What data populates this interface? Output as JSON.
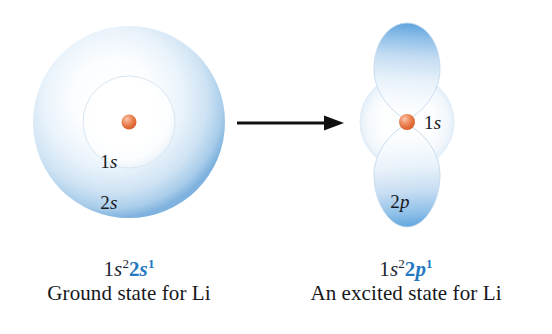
{
  "figure": {
    "type": "orbital-diagram"
  },
  "colors": {
    "orbital_blue_edge": "#6fa8dc",
    "orbital_blue_deep": "#4a90d9",
    "orbital_pale": "#eaf2fa",
    "nucleus_orange": "#e8743b",
    "nucleus_highlight": "#f6b79a",
    "config_blue": "#2478c0",
    "text_dark": "#17181c",
    "arrow_black": "#101010"
  },
  "left_diagram": {
    "name": "ground-state-orbital",
    "inner_label": "1s",
    "inner_label_italic": "s",
    "outer_label": "2s",
    "outer_label_italic": "s",
    "nucleus": "nucleus",
    "inner_shell_text_plain": "1",
    "outer_shell_text_plain": "2"
  },
  "right_diagram": {
    "name": "excited-state-orbital",
    "s_label": "1s",
    "s_label_plain": "1",
    "s_label_italic": "s",
    "p_label": "2p",
    "p_label_plain": "2",
    "p_label_italic": "p",
    "nucleus": "nucleus"
  },
  "arrow": {
    "name": "transition-arrow",
    "direction": "right"
  },
  "left_caption": {
    "config_part1_base": "1",
    "config_part1_orbital": "s",
    "config_part1_sup": "2",
    "config_part2_base": "2",
    "config_part2_orbital": "s",
    "config_part2_sup": "1",
    "config_full": "1s22s1",
    "state_name": "Ground state for Li"
  },
  "right_caption": {
    "config_part1_base": "1",
    "config_part1_orbital": "s",
    "config_part1_sup": "2",
    "config_part2_base": "2",
    "config_part2_orbital": "p",
    "config_part2_sup": "1",
    "config_full": "1s22p1",
    "state_name": "An excited state for Li"
  }
}
